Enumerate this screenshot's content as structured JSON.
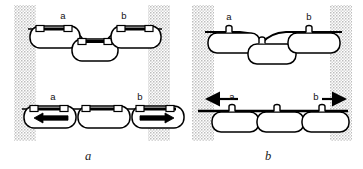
{
  "figure": {
    "width": 363,
    "height": 169,
    "background_color": "#ffffff",
    "stroke_color": "#000000",
    "fill_color": "#ffffff",
    "stipple_color": "#b9b9b9",
    "caption_color": "#1a1a1a"
  },
  "panels": [
    {
      "id": "panel-a",
      "caption": "a",
      "caption_position": {
        "x": 88,
        "y": 159
      },
      "bounds": {
        "x": 0,
        "y": 0,
        "width": 181,
        "height": 169
      },
      "stipple_columns": [
        {
          "name": "left-boundary",
          "x": 14,
          "y": 5,
          "width": 22,
          "height": 136
        },
        {
          "name": "right-boundary",
          "x": 148,
          "y": 5,
          "width": 22,
          "height": 136
        }
      ],
      "rows": [
        {
          "id": "upper-row",
          "description": "three cells on a slack wavy membrane, outer cells raised, middle cell sagging",
          "membrane_style": "wavy",
          "cells": [
            {
              "id": "cell-left",
              "x": 30,
              "y": 24,
              "width": 50,
              "height": 22,
              "attachment_type": "double-square",
              "label": "a",
              "label_x": 63,
              "label_y": 18,
              "arrow": null
            },
            {
              "id": "cell-middle",
              "x": 73,
              "y": 38,
              "width": 44,
              "height": 21,
              "attachment_type": "double-square",
              "label": null,
              "arrow": null
            },
            {
              "id": "cell-right",
              "x": 112,
              "y": 24,
              "width": 50,
              "height": 22,
              "attachment_type": "double-square",
              "label": "b",
              "label_x": 124,
              "label_y": 18,
              "arrow": null
            }
          ]
        },
        {
          "id": "lower-row",
          "description": "three cells hanging from a taut straight membrane, outer cells contain opposing arrows",
          "membrane_style": "straight",
          "cells": [
            {
              "id": "cell-left",
              "x": 24,
              "y": 106,
              "width": 52,
              "height": 22,
              "attachment_type": "double-square",
              "label": "a",
              "label_x": 53,
              "label_y": 99,
              "arrow": "left"
            },
            {
              "id": "cell-middle",
              "x": 78,
              "y": 106,
              "width": 52,
              "height": 22,
              "attachment_type": "double-square",
              "label": null,
              "arrow": null
            },
            {
              "id": "cell-right",
              "x": 132,
              "y": 106,
              "width": 52,
              "height": 22,
              "attachment_type": "double-square",
              "label": "b",
              "label_x": 137,
              "label_y": 99,
              "arrow": "right"
            }
          ]
        }
      ]
    },
    {
      "id": "panel-b",
      "caption": "b",
      "caption_position": {
        "x": 268,
        "y": 159
      },
      "bounds": {
        "x": 181,
        "y": 0,
        "width": 182,
        "height": 169
      },
      "stipple_columns": [
        {
          "name": "left-boundary",
          "x": 192,
          "y": 5,
          "width": 22,
          "height": 136
        },
        {
          "name": "right-boundary",
          "x": 330,
          "y": 5,
          "width": 22,
          "height": 136
        }
      ],
      "rows": [
        {
          "id": "upper-row",
          "description": "three cells on a slack wavy membrane, single narrow stalk attachments",
          "membrane_style": "wavy",
          "cells": [
            {
              "id": "cell-left",
              "x": 208,
              "y": 28,
              "width": 52,
              "height": 20,
              "attachment_type": "single-stalk",
              "label": "a",
              "label_x": 228,
              "label_y": 19,
              "arrow": null
            },
            {
              "id": "cell-middle",
              "x": 250,
              "y": 40,
              "width": 48,
              "height": 20,
              "attachment_type": "single-stalk",
              "label": null,
              "arrow": null
            },
            {
              "id": "cell-right",
              "x": 288,
              "y": 28,
              "width": 52,
              "height": 20,
              "attachment_type": "single-stalk",
              "label": "b",
              "label_x": 308,
              "label_y": 19,
              "arrow": null
            }
          ]
        },
        {
          "id": "lower-row",
          "description": "three abutting cells on a taut straight membrane, large external arrows pull outward",
          "membrane_style": "straight",
          "cells": [
            {
              "id": "cell-left",
              "x": 212,
              "y": 110,
              "width": 46,
              "height": 20,
              "attachment_type": "single-stalk",
              "label": "a",
              "label_x": 229,
              "label_y": 99,
              "arrow": null
            },
            {
              "id": "cell-middle",
              "x": 257,
              "y": 110,
              "width": 46,
              "height": 20,
              "attachment_type": "single-stalk",
              "label": null,
              "arrow": null
            },
            {
              "id": "cell-right",
              "x": 302,
              "y": 110,
              "width": 46,
              "height": 20,
              "attachment_type": "single-stalk",
              "label": "b",
              "label_x": 314,
              "label_y": 99,
              "arrow": null
            }
          ],
          "external_arrows": [
            {
              "id": "tension-arrow-left",
              "direction": "left",
              "x1": 237,
              "x2": 200,
              "y": 99
            },
            {
              "id": "tension-arrow-right",
              "direction": "right",
              "x1": 325,
              "x2": 350,
              "y": 99
            }
          ]
        }
      ]
    }
  ]
}
